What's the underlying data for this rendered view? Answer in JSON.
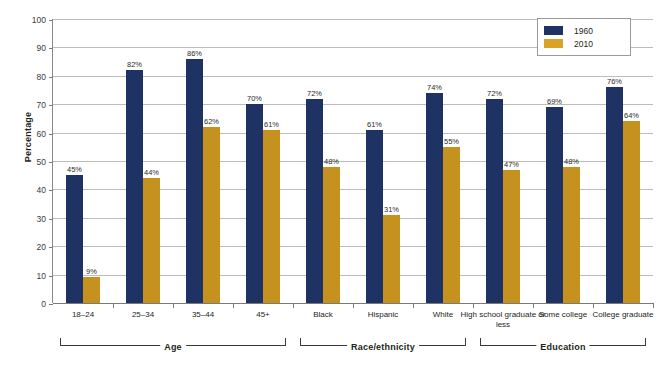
{
  "chart_data": {
    "type": "bar",
    "title": "",
    "subtitle": "",
    "xlabel": "",
    "ylabel": "Percentage",
    "ylim": [
      0,
      100
    ],
    "ytick_step": 10,
    "yticks": [
      0,
      10,
      20,
      30,
      40,
      50,
      60,
      70,
      80,
      90,
      100
    ],
    "grid": true,
    "legend_position": "top-right",
    "value_suffix": "%",
    "categories": [
      "18–24",
      "25–34",
      "35–44",
      "45+",
      "Black",
      "Hispanic",
      "White",
      "High school graduate or less",
      "Some college",
      "College graduate"
    ],
    "series": [
      {
        "name": "1960",
        "color": "#1e3264",
        "values": [
          45,
          82,
          86,
          70,
          72,
          61,
          74,
          72,
          69,
          76
        ]
      },
      {
        "name": "2010",
        "color": "#c6921f",
        "values": [
          9,
          44,
          62,
          61,
          48,
          31,
          55,
          47,
          48,
          64
        ]
      }
    ],
    "groups": [
      {
        "label": "Age",
        "categories": [
          "18–24",
          "25–34",
          "35–44",
          "45+"
        ]
      },
      {
        "label": "Race/ethnicity",
        "categories": [
          "Black",
          "Hispanic",
          "White"
        ]
      },
      {
        "label": "Education",
        "categories": [
          "High school graduate or less",
          "Some college",
          "College graduate"
        ]
      }
    ],
    "annotations": []
  },
  "legend": {
    "entries": [
      {
        "label": "1960",
        "color": "#1e3264"
      },
      {
        "label": "2010",
        "color": "#d9a328"
      }
    ]
  },
  "axis": {
    "y_title": "Percentage"
  }
}
